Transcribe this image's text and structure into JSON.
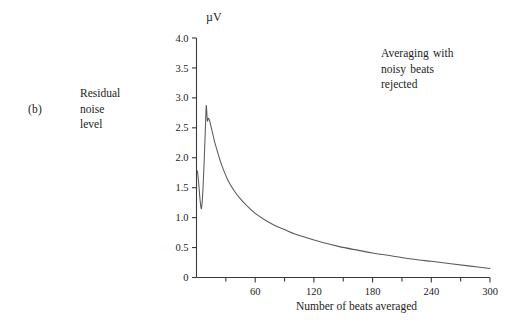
{
  "figure": {
    "panel_letter": "(b)",
    "y_description": "Residual\nnoise\nlevel",
    "unit_label": "µV",
    "annotation": "Averaging  with\nnoisy  beats\nrejected",
    "x_title": "Number of beats averaged",
    "line_color": "#5a5a5a",
    "axis_color": "#3a3a3a",
    "background_color": "#ffffff"
  },
  "chart_data": {
    "type": "line",
    "title": "",
    "subtitle": "",
    "xlabel": "Number of beats averaged",
    "ylabel": "Residual noise level",
    "yunit": "µV",
    "xlim": [
      0,
      300
    ],
    "ylim": [
      0,
      4.0
    ],
    "grid": false,
    "legend": null,
    "annotations": [
      {
        "text": "Averaging  with\nnoisy  beats\nrejected",
        "x": 195,
        "y": 3.55
      }
    ],
    "xticks": [
      60,
      120,
      180,
      240,
      300
    ],
    "xticklabels": [
      "60",
      "120",
      "180",
      "240",
      "300"
    ],
    "xminorticks": [
      30,
      90,
      150,
      210,
      270
    ],
    "yticks": [
      0,
      0.5,
      1.0,
      1.5,
      2.0,
      2.5,
      3.0,
      3.5,
      4.0
    ],
    "yticklabels": [
      "0",
      "0.5",
      "1.0",
      "1.5",
      "2.0",
      "2.5",
      "3.0",
      "3.5",
      "4.0"
    ],
    "series": [
      {
        "name": "Residual noise level (noisy beats rejected)",
        "x": [
          1,
          2,
          3,
          4,
          5,
          6,
          7,
          8,
          9,
          10,
          11,
          12,
          13,
          14,
          16,
          18,
          20,
          24,
          28,
          32,
          38,
          44,
          52,
          60,
          70,
          80,
          90,
          100,
          115,
          130,
          145,
          160,
          180,
          200,
          220,
          240,
          260,
          280,
          300
        ],
        "y": [
          1.78,
          1.62,
          1.42,
          1.24,
          1.15,
          1.3,
          1.62,
          2.0,
          2.45,
          2.87,
          2.62,
          2.66,
          2.64,
          2.58,
          2.44,
          2.3,
          2.18,
          1.96,
          1.78,
          1.63,
          1.46,
          1.33,
          1.19,
          1.07,
          0.96,
          0.87,
          0.8,
          0.73,
          0.65,
          0.58,
          0.52,
          0.47,
          0.41,
          0.36,
          0.31,
          0.27,
          0.23,
          0.19,
          0.15
        ]
      }
    ]
  }
}
